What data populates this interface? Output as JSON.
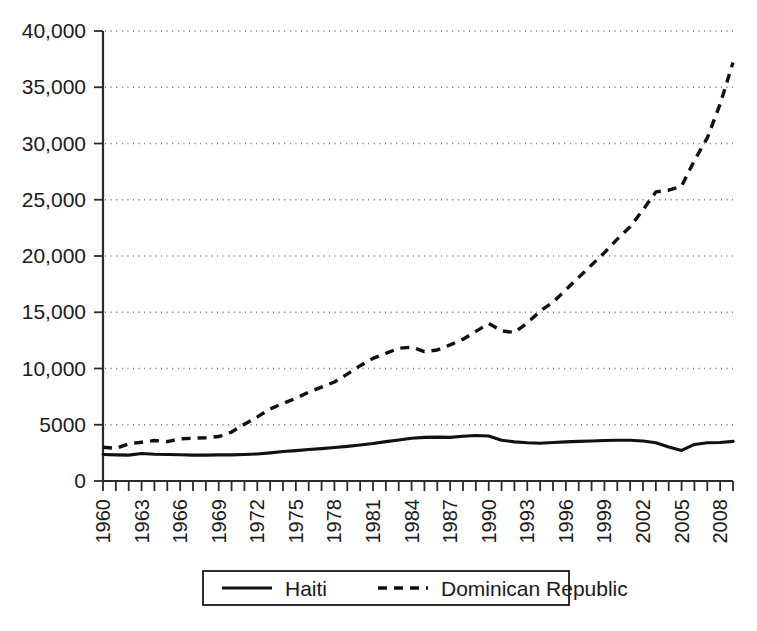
{
  "chart_data": {
    "type": "line",
    "title": "",
    "xlabel": "",
    "ylabel": "",
    "xlim": [
      1960,
      2009
    ],
    "ylim": [
      0,
      40000
    ],
    "grid": true,
    "legend_position": "bottom",
    "y_ticks": [
      0,
      5000,
      10000,
      15000,
      20000,
      25000,
      30000,
      35000,
      40000
    ],
    "y_tick_labels": [
      "0",
      "5000",
      "10,000",
      "15,000",
      "20,000",
      "25,000",
      "30,000",
      "35,000",
      "40,000"
    ],
    "x_tick_labels": [
      "1960",
      "1963",
      "1966",
      "1969",
      "1972",
      "1975",
      "1978",
      "1981",
      "1984",
      "1987",
      "1990",
      "1993",
      "1996",
      "1999",
      "2002",
      "2005",
      "2008"
    ],
    "x": [
      1960,
      1961,
      1962,
      1963,
      1964,
      1965,
      1966,
      1967,
      1968,
      1969,
      1970,
      1971,
      1972,
      1973,
      1974,
      1975,
      1976,
      1977,
      1978,
      1979,
      1980,
      1981,
      1982,
      1983,
      1984,
      1985,
      1986,
      1987,
      1988,
      1989,
      1990,
      1991,
      1992,
      1993,
      1994,
      1995,
      1996,
      1997,
      1998,
      1999,
      2000,
      2001,
      2002,
      2003,
      2004,
      2005,
      2006,
      2007,
      2008,
      2009
    ],
    "series": [
      {
        "name": "Haiti",
        "style": "solid",
        "color": "#111111",
        "values": [
          2350,
          2320,
          2300,
          2450,
          2380,
          2360,
          2330,
          2300,
          2300,
          2320,
          2320,
          2350,
          2400,
          2500,
          2620,
          2700,
          2800,
          2880,
          2980,
          3080,
          3200,
          3330,
          3500,
          3640,
          3800,
          3880,
          3900,
          3880,
          3980,
          4050,
          4000,
          3620,
          3480,
          3400,
          3360,
          3420,
          3480,
          3520,
          3560,
          3600,
          3620,
          3620,
          3560,
          3400,
          3020,
          2720,
          3250,
          3400,
          3420,
          3520
        ]
      },
      {
        "name": "Dominican Republic",
        "style": "dashed",
        "color": "#111111",
        "values": [
          3000,
          2900,
          3300,
          3450,
          3600,
          3500,
          3750,
          3800,
          3850,
          3950,
          4350,
          5050,
          5700,
          6400,
          6900,
          7350,
          7900,
          8350,
          8800,
          9500,
          10250,
          10900,
          11350,
          11800,
          11900,
          11500,
          11650,
          12100,
          12600,
          13300,
          14000,
          13350,
          13200,
          14050,
          15100,
          15900,
          17000,
          18100,
          19200,
          20300,
          21500,
          22600,
          24100,
          25700,
          25850,
          26200,
          28500,
          30500,
          33500,
          37200
        ]
      }
    ]
  },
  "legend": {
    "entries": [
      {
        "label": "Haiti",
        "style": "solid"
      },
      {
        "label": "Dominican Republic",
        "style": "dashed"
      }
    ]
  }
}
